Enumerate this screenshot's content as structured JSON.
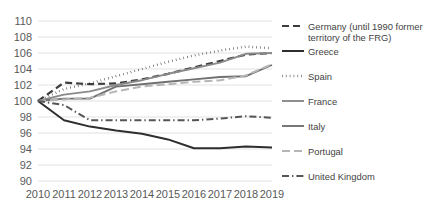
{
  "chart_data": {
    "type": "line",
    "title": "",
    "xlabel": "",
    "ylabel": "",
    "x": [
      2010,
      2011,
      2012,
      2013,
      2014,
      2015,
      2016,
      2017,
      2018,
      2019
    ],
    "xtick_labels": [
      "2010",
      "2011",
      "2012",
      "2013",
      "2014",
      "2015",
      "2016",
      "2017",
      "2018",
      "2019"
    ],
    "ytick_labels": [
      "90",
      "92",
      "94",
      "96",
      "98",
      "100",
      "102",
      "104",
      "106",
      "108",
      "110"
    ],
    "ytick_values": [
      90,
      92,
      94,
      96,
      98,
      100,
      102,
      104,
      106,
      108,
      110
    ],
    "ylim": [
      90,
      110
    ],
    "xlim": [
      2010,
      2019
    ],
    "grid": "horizontal",
    "legend_position": "right",
    "series": [
      {
        "name": "Germany (until 1990 former territory of the FRG)",
        "legend_label": "Germany (until 1990 former territory of the FRG)",
        "color": "#3d3d3d",
        "style": "dashed",
        "width": 2.2,
        "dasharray": "7,4",
        "values": [
          100.0,
          102.3,
          102.1,
          102.2,
          102.7,
          103.4,
          104.2,
          105.0,
          105.8,
          106.0
        ]
      },
      {
        "name": "Greece",
        "legend_label": "Greece",
        "color": "#2e2e2e",
        "style": "solid",
        "width": 2.0,
        "dasharray": "none",
        "values": [
          100.0,
          97.6,
          96.8,
          96.3,
          95.9,
          95.2,
          94.1,
          94.1,
          94.3,
          94.2
        ]
      },
      {
        "name": "Spain",
        "legend_label": "Spain",
        "color": "#242424",
        "style": "dotted",
        "width": 2.4,
        "dasharray": "0.5,3.4",
        "values": [
          100.0,
          101.5,
          102.2,
          103.1,
          104.0,
          104.9,
          105.7,
          106.3,
          106.8,
          106.6
        ]
      },
      {
        "name": "France",
        "legend_label": "France",
        "color": "#8a8a8a",
        "style": "solid",
        "width": 1.9,
        "dasharray": "none",
        "values": [
          100.0,
          100.8,
          101.2,
          102.0,
          102.6,
          103.4,
          104.1,
          104.8,
          105.9,
          106.0
        ]
      },
      {
        "name": "Italy",
        "legend_label": "Italy",
        "color": "#707070",
        "style": "solid",
        "width": 1.9,
        "dasharray": "none",
        "values": [
          100.0,
          100.3,
          100.3,
          101.8,
          102.1,
          102.4,
          102.7,
          103.0,
          103.1,
          104.5
        ]
      },
      {
        "name": "Portugal",
        "legend_label": "Portugal",
        "color": "#b5b5b5",
        "style": "dashed",
        "width": 2.0,
        "dasharray": "8,4",
        "values": [
          100.0,
          100.2,
          100.4,
          101.2,
          101.8,
          102.1,
          102.4,
          102.6,
          103.2,
          104.6
        ]
      },
      {
        "name": "United Kingdom",
        "legend_label": "United Kingdom",
        "color": "#555555",
        "style": "dash-dot",
        "width": 2.0,
        "dasharray": "7,3,1.4,3",
        "values": [
          100.0,
          99.5,
          97.6,
          97.6,
          97.6,
          97.6,
          97.6,
          97.8,
          98.1,
          97.9
        ]
      }
    ]
  },
  "legend": {
    "entries": [
      {
        "label": "Germany (until 1990 former territory of the FRG)"
      },
      {
        "label": "Greece"
      },
      {
        "label": "Spain"
      },
      {
        "label": "France"
      },
      {
        "label": "Italy"
      },
      {
        "label": "Portugal"
      },
      {
        "label": "United Kingdom"
      }
    ]
  }
}
